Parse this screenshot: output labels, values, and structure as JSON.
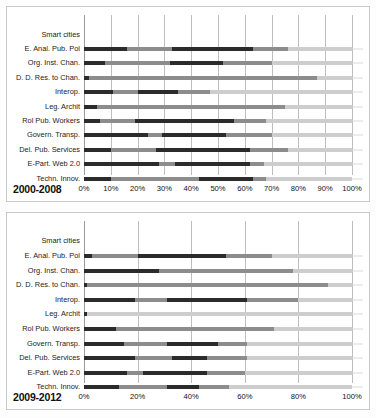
{
  "chart_data": [
    {
      "type": "bar",
      "title": "2000-2008",
      "orientation": "horizontal",
      "stacked": true,
      "stack_mode": "percent",
      "xlabel": "",
      "ylabel": "",
      "xlim": [
        0,
        100
      ],
      "xticks": [
        "0%",
        "10%",
        "20%",
        "30%",
        "40%",
        "50%",
        "60%",
        "70%",
        "80%",
        "90%",
        "100%"
      ],
      "xtick_values": [
        0,
        10,
        20,
        30,
        40,
        50,
        60,
        70,
        80,
        90,
        100
      ],
      "grid": true,
      "legend": "none",
      "header_label": "Smart cities",
      "categories": [
        "E. Anal. Pub. Pol",
        "Org. Inst. Chan.",
        "D. D. Res. to Chan.",
        "Interop.",
        "Leg. Archit",
        "Rol Pub. Workers",
        "Govern. Transp.",
        "Del. Pub. Services",
        "E-Part. Web 2.0",
        "Techn. Innov."
      ],
      "series": [
        {
          "name": "Segment 1",
          "color": "#2b2b2b",
          "values": [
            16,
            8,
            2,
            11,
            5,
            6,
            24,
            10,
            28,
            10
          ]
        },
        {
          "name": "Segment 2",
          "color": "#8c8c8c",
          "values": [
            17,
            24,
            8,
            9,
            42,
            13,
            5,
            17,
            6,
            33
          ]
        },
        {
          "name": "Segment 3",
          "color": "#2b2b2b",
          "values": [
            30,
            20,
            0,
            15,
            0,
            37,
            24,
            35,
            28,
            20
          ]
        },
        {
          "name": "Segment 4",
          "color": "#8c8c8c",
          "values": [
            13,
            18,
            77,
            12,
            28,
            12,
            17,
            14,
            5,
            5
          ]
        },
        {
          "name": "Segment 5",
          "color": "#cdcdcd",
          "values": [
            24,
            30,
            13,
            53,
            25,
            32,
            30,
            24,
            33,
            32
          ]
        }
      ]
    },
    {
      "type": "bar",
      "title": "2009-2012",
      "orientation": "horizontal",
      "stacked": true,
      "stack_mode": "percent",
      "xlabel": "",
      "ylabel": "",
      "xlim": [
        0,
        100
      ],
      "xticks": [
        "0%",
        "20%",
        "40%",
        "60%",
        "80%",
        "100%"
      ],
      "xtick_values": [
        0,
        20,
        40,
        60,
        80,
        100
      ],
      "grid": true,
      "legend": "none",
      "header_label": "Smart cities",
      "categories": [
        "E. Anal. Pub. Pol",
        "Org. Inst. Chan.",
        "D. D. Res. to Chan.",
        "Interop.",
        "Leg. Archit",
        "Rol Pub. Workers",
        "Govern. Transp.",
        "Del. Pub. Services",
        "E-Part. Web 2.0",
        "Techn. Innov."
      ],
      "series": [
        {
          "name": "Segment 1",
          "color": "#2b2b2b",
          "values": [
            3,
            28,
            1,
            19,
            1,
            12,
            15,
            19,
            16,
            13
          ]
        },
        {
          "name": "Segment 2",
          "color": "#8c8c8c",
          "values": [
            17,
            8,
            0,
            12,
            0,
            19,
            16,
            14,
            6,
            18
          ]
        },
        {
          "name": "Segment 3",
          "color": "#2b2b2b",
          "values": [
            33,
            0,
            0,
            30,
            0,
            0,
            19,
            13,
            24,
            12
          ]
        },
        {
          "name": "Segment 4",
          "color": "#8c8c8c",
          "values": [
            17,
            42,
            90,
            19,
            0,
            40,
            11,
            15,
            14,
            11
          ]
        },
        {
          "name": "Segment 5",
          "color": "#cdcdcd",
          "values": [
            30,
            22,
            9,
            20,
            99,
            29,
            39,
            39,
            40,
            46
          ]
        }
      ]
    }
  ]
}
